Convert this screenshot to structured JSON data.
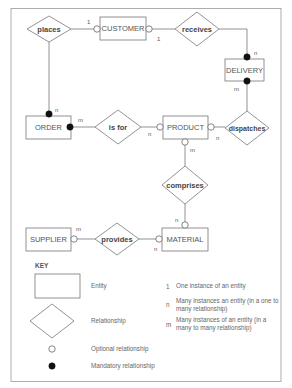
{
  "entities": {
    "customer": "CUSTOMER",
    "delivery": "DELIVERY",
    "order": "ORDER",
    "product": "PRODUCT",
    "supplier": "SUPPLIER",
    "material": "MATERIAL"
  },
  "relationships": {
    "places": "places",
    "receives": "receives",
    "is_for": "is for",
    "dispatches": "dispatches",
    "comprises": "comprises",
    "provides": "provides"
  },
  "cardinalities": {
    "customer_places": "1",
    "customer_receives": "1",
    "delivery_receives": "n",
    "delivery_dispatches": "m",
    "order_places": "n",
    "order_is_for": "m",
    "product_is_for": "n",
    "product_dispatches": "n",
    "product_comprises": "m",
    "material_comprises": "n",
    "material_provides": "n",
    "supplier_provides": "m"
  },
  "connections": [
    {
      "entity": "CUSTOMER",
      "relationship": "places",
      "participation": "optional",
      "cardinality": "1"
    },
    {
      "entity": "ORDER",
      "relationship": "places",
      "participation": "mandatory",
      "cardinality": "n"
    },
    {
      "entity": "CUSTOMER",
      "relationship": "receives",
      "participation": "optional",
      "cardinality": "1"
    },
    {
      "entity": "DELIVERY",
      "relationship": "receives",
      "participation": "mandatory",
      "cardinality": "n"
    },
    {
      "entity": "DELIVERY",
      "relationship": "dispatches",
      "participation": "mandatory",
      "cardinality": "m"
    },
    {
      "entity": "PRODUCT",
      "relationship": "dispatches",
      "participation": "optional",
      "cardinality": "n"
    },
    {
      "entity": "ORDER",
      "relationship": "is for",
      "participation": "mandatory",
      "cardinality": "m"
    },
    {
      "entity": "PRODUCT",
      "relationship": "is for",
      "participation": "optional",
      "cardinality": "n"
    },
    {
      "entity": "PRODUCT",
      "relationship": "comprises",
      "participation": "optional",
      "cardinality": "m"
    },
    {
      "entity": "MATERIAL",
      "relationship": "comprises",
      "participation": "optional",
      "cardinality": "n"
    },
    {
      "entity": "SUPPLIER",
      "relationship": "provides",
      "participation": "optional",
      "cardinality": "m"
    },
    {
      "entity": "MATERIAL",
      "relationship": "provides",
      "participation": "optional",
      "cardinality": "n"
    }
  ],
  "key": {
    "title": "KEY",
    "entity": "Entity",
    "relationship": "Relationship",
    "optional": "Optional relationship",
    "mandatory": "Mandatory relationship",
    "one_symbol": "1",
    "one_text": "One instance of an entity",
    "n_symbol": "n",
    "n_text_line1": "Many instances an  entity (in a one to",
    "n_text_line2": "many relationship)",
    "m_symbol": "m",
    "m_text_line1": "Many instances of an entity (in a",
    "m_text_line2": "many to many relationship)"
  },
  "colors": {
    "line": "#777777",
    "mandatory": "#111111",
    "background": "#ffffff"
  }
}
